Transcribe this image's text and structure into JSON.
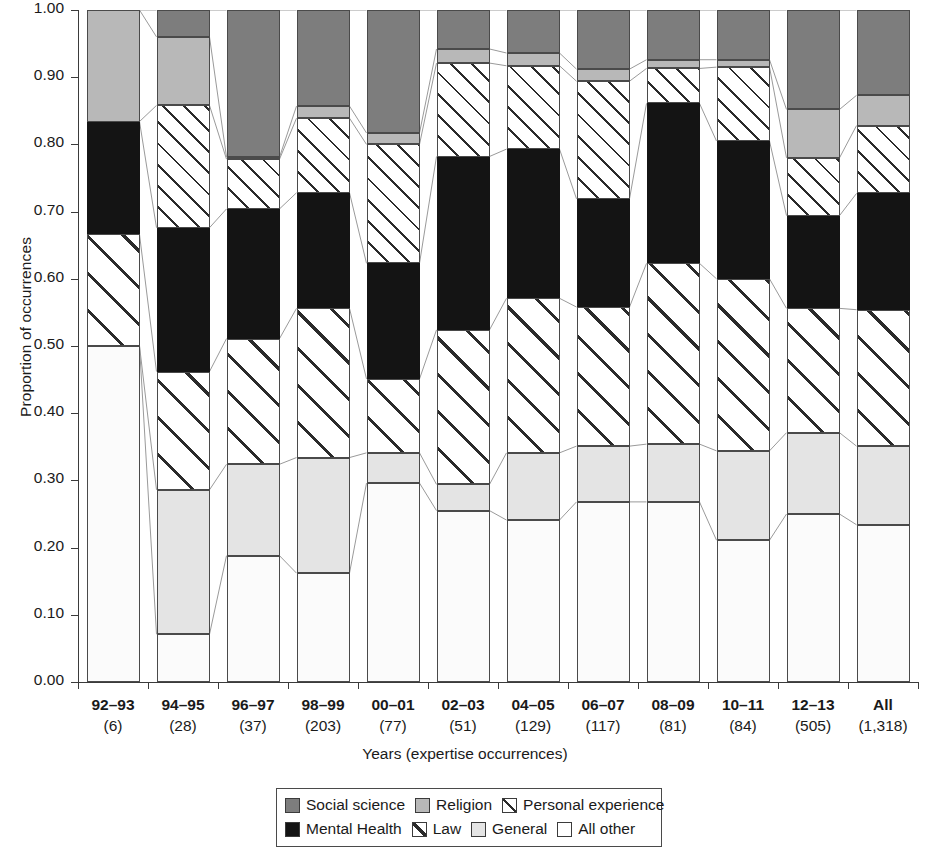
{
  "chart_data": {
    "type": "bar",
    "title": "",
    "subtitle": "",
    "xlabel": "Years (expertise occurrences)",
    "ylabel": "Proportion of occurrences",
    "ylim": [
      0.0,
      1.0
    ],
    "ytick_labels": [
      "1.00",
      "0.90",
      "0.80",
      "0.70",
      "0.60",
      "0.50",
      "0.40",
      "0.30",
      "0.20",
      "0.10",
      "0.00"
    ],
    "ytick_values": [
      1.0,
      0.9,
      0.8,
      0.7,
      0.6,
      0.5,
      0.4,
      0.3,
      0.2,
      0.1,
      0.0
    ],
    "grid": false,
    "stacked": true,
    "legend_position": "bottom",
    "categories": [
      "92–93",
      "94–95",
      "96–97",
      "98–99",
      "00–01",
      "02–03",
      "04–05",
      "06–07",
      "08–09",
      "10–11",
      "12–13",
      "All"
    ],
    "category_counts": [
      "(6)",
      "(28)",
      "(37)",
      "(203)",
      "(77)",
      "(51)",
      "(129)",
      "(117)",
      "(81)",
      "(84)",
      "(505)",
      "(1,318)"
    ],
    "series": [
      {
        "name": "All other",
        "key": "allother",
        "color": "#fbfbfb",
        "values": [
          0.5,
          0.071,
          0.188,
          0.162,
          0.296,
          0.255,
          0.241,
          0.268,
          0.268,
          0.211,
          0.25,
          0.234
        ]
      },
      {
        "name": "General",
        "key": "general",
        "color": "#e4e4e4",
        "values": [
          0.0,
          0.215,
          0.136,
          0.172,
          0.045,
          0.039,
          0.1,
          0.083,
          0.086,
          0.133,
          0.121,
          0.117
        ]
      },
      {
        "name": "Law",
        "key": "law",
        "color": "#ffffff",
        "values": [
          0.166,
          0.176,
          0.187,
          0.222,
          0.11,
          0.23,
          0.23,
          0.207,
          0.269,
          0.256,
          0.185,
          0.203
        ]
      },
      {
        "name": "Mental Health",
        "key": "mental",
        "color": "#141414",
        "values": [
          0.168,
          0.214,
          0.193,
          0.172,
          0.172,
          0.258,
          0.222,
          0.161,
          0.238,
          0.205,
          0.138,
          0.173
        ]
      },
      {
        "name": "Personal experience",
        "key": "personal",
        "color": "#ffffff",
        "values": [
          0.0,
          0.182,
          0.074,
          0.111,
          0.177,
          0.139,
          0.124,
          0.175,
          0.052,
          0.11,
          0.086,
          0.101
        ]
      },
      {
        "name": "Religion",
        "key": "religion",
        "color": "#b8b8b8",
        "values": [
          0.166,
          0.102,
          0.003,
          0.018,
          0.017,
          0.021,
          0.019,
          0.018,
          0.013,
          0.011,
          0.072,
          0.045
        ]
      },
      {
        "name": "Social science",
        "key": "social",
        "color": "#7d7d7d",
        "values": [
          0.0,
          0.04,
          0.219,
          0.143,
          0.183,
          0.058,
          0.064,
          0.088,
          0.074,
          0.074,
          0.148,
          0.127
        ]
      }
    ]
  },
  "legend": {
    "rows": [
      [
        {
          "label": "Social science",
          "swatch": "social"
        },
        {
          "label": "Religion",
          "swatch": "religion"
        },
        {
          "label": "Personal experience",
          "swatch": "personal"
        }
      ],
      [
        {
          "label": "Mental Health",
          "swatch": "mental"
        },
        {
          "label": "Law",
          "swatch": "law"
        },
        {
          "label": "General",
          "swatch": "general"
        },
        {
          "label": "All other",
          "swatch": "allother"
        }
      ]
    ]
  }
}
